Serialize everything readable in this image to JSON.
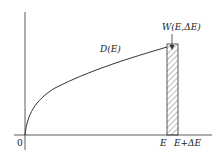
{
  "diagram": {
    "curve_label": "D(E)",
    "bar_label": "W(E,ΔE)",
    "origin_label": "0",
    "x_label_e": "E",
    "x_label_e_plus": "E+ΔE",
    "colors": {
      "line": "#333333",
      "hatch": "#555555",
      "background": "#ffffff"
    }
  }
}
